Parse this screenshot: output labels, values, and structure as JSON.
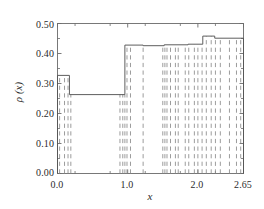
{
  "chart_data": {
    "type": "bar",
    "title": "",
    "xlabel": "x",
    "ylabel": "ρ (x)",
    "xlim": [
      0.0,
      2.65
    ],
    "ylim": [
      0.0,
      0.5
    ],
    "grid": false,
    "legend": null,
    "ytick_labels": [
      "0.50",
      "0.40",
      "0.30",
      "0.20",
      "0.10",
      "0.00"
    ],
    "ytick_values": [
      0.5,
      0.4,
      0.3,
      0.2,
      0.1,
      0.0
    ],
    "xtick_labels": [
      "0.0",
      "1.0",
      "2.0",
      "2.65"
    ],
    "xtick_values": [
      0.0,
      1.0,
      2.0,
      2.65
    ],
    "bin_edges": [
      0.0,
      0.17,
      0.96,
      1.22,
      1.52,
      1.86,
      2.07,
      2.24,
      2.65
    ],
    "values": [
      0.327,
      0.263,
      0.428,
      0.426,
      0.429,
      0.431,
      0.458,
      0.451
    ],
    "step_line_style": "solid",
    "event_lines_style": "dashed",
    "event_lines_x": [
      0.03,
      0.1,
      0.15,
      0.19,
      0.89,
      0.93,
      0.96,
      0.99,
      1.04,
      1.22,
      1.5,
      1.53,
      1.56,
      1.61,
      1.68,
      1.72,
      1.82,
      1.87,
      1.95,
      2.0,
      2.06,
      2.12,
      2.19,
      2.25,
      2.32,
      2.45,
      2.55,
      2.61
    ],
    "colors": {
      "step": "#555555",
      "event_line": "#8a8a8a",
      "frame": "#6b6b6b",
      "text": "#2b2b2b",
      "background": "#ffffff"
    }
  }
}
